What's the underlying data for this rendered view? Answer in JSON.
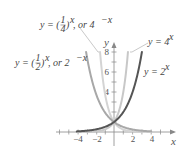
{
  "chart_data": {
    "type": "line",
    "title": "",
    "xlabel": "x",
    "ylabel": "y",
    "xlim": [
      -5.5,
      6
    ],
    "ylim": [
      0,
      8.5
    ],
    "x_ticks": [
      -4,
      -2,
      2,
      4
    ],
    "y_ticks": [
      4,
      6,
      8
    ],
    "grid": false,
    "series": [
      {
        "name": "y = 2^x",
        "label": "y = 2",
        "exponent": "x",
        "color": "#555555",
        "x": [
          -4,
          -3,
          -2,
          -1,
          0,
          1,
          2,
          3
        ],
        "values": [
          0.0625,
          0.125,
          0.25,
          0.5,
          1,
          2,
          4,
          8
        ]
      },
      {
        "name": "y = 4^x",
        "label": "y = 4",
        "exponent": "x",
        "color": "#c8c8c8",
        "x": [
          -4,
          -3,
          -2,
          -1,
          0,
          0.5,
          1,
          1.5
        ],
        "values": [
          0.0039,
          0.0156,
          0.0625,
          0.25,
          1,
          2,
          4,
          8
        ]
      },
      {
        "name": "y = (1/2)^x, or 2^-x",
        "label_a": "y = (",
        "label_frac_num": "1",
        "label_frac_den": "2",
        "label_b": ")",
        "label_exp": "x",
        "label_c": ", or 2",
        "label_exp2": "−x",
        "color": "#a8a8a8",
        "x": [
          -3,
          -2,
          -1,
          0,
          1,
          2,
          3,
          4
        ],
        "values": [
          8,
          4,
          2,
          1,
          0.5,
          0.25,
          0.125,
          0.0625
        ]
      },
      {
        "name": "y = (1/4)^x, or 4^-x",
        "label_a": "y = (",
        "label_frac_num": "1",
        "label_frac_den": "4",
        "label_b": ")",
        "label_exp": "x",
        "label_c": ", or 4",
        "label_exp2": "−x",
        "color": "#d4d4d4",
        "x": [
          -1.5,
          -1,
          -0.5,
          0,
          1,
          2,
          3,
          4
        ],
        "values": [
          8,
          4,
          2,
          1,
          0.25,
          0.0625,
          0.0156,
          0.0039
        ]
      }
    ]
  },
  "axes": {
    "x_label": "x",
    "y_label": "y",
    "x_tick_labels": [
      "−4",
      "−2",
      "2",
      "4"
    ],
    "y_tick_labels": [
      "8",
      "6",
      "4"
    ]
  }
}
